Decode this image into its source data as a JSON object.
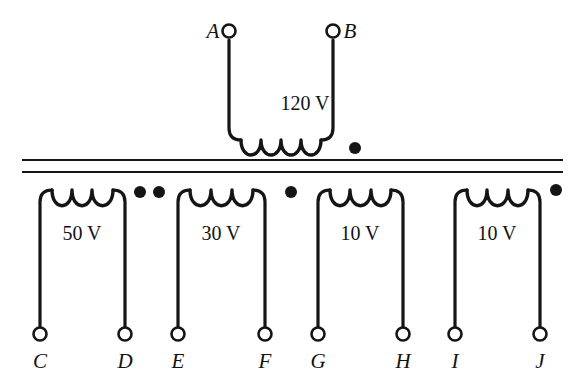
{
  "figure": {
    "background_color": "#ffffff",
    "ink_color": "#151515"
  },
  "core": {
    "name": "transformer-core",
    "lines": 2,
    "y_positions": [
      160,
      172
    ],
    "x_start": 22,
    "x_end": 563
  },
  "primary": {
    "label": "120 V",
    "label_x": 305,
    "label_y": 110,
    "terminals": [
      {
        "id": "A",
        "label": "A",
        "x": 229,
        "y": 31,
        "label_side": "left"
      },
      {
        "id": "B",
        "label": "B",
        "x": 333,
        "y": 31,
        "label_side": "right"
      }
    ],
    "coil_turns": 4,
    "coil_y": 140,
    "dot": {
      "x": 355,
      "y": 148,
      "r": 6
    }
  },
  "secondaries": [
    {
      "name": "secondary-50v",
      "label": "50 V",
      "label_x": 82,
      "label_y": 240,
      "coil_turns": 3,
      "coil_y": 190,
      "left_x": 40,
      "right_x": 125,
      "terminal_y": 334,
      "terminals": [
        {
          "id": "C",
          "label": "C",
          "x": 40
        },
        {
          "id": "D",
          "label": "D",
          "x": 125
        }
      ],
      "dots": [
        {
          "x": 140,
          "y": 192,
          "r": 6
        },
        {
          "x": 159,
          "y": 192,
          "r": 6
        }
      ]
    },
    {
      "name": "secondary-30v",
      "label": "30 V",
      "label_x": 221,
      "label_y": 240,
      "coil_turns": 3,
      "coil_y": 190,
      "left_x": 178,
      "right_x": 265,
      "terminal_y": 334,
      "terminals": [
        {
          "id": "E",
          "label": "E",
          "x": 178
        },
        {
          "id": "F",
          "label": "F",
          "x": 265
        }
      ],
      "dots": [
        {
          "x": 291,
          "y": 192,
          "r": 6
        }
      ]
    },
    {
      "name": "secondary-10v-first",
      "label": "10 V",
      "label_x": 360,
      "label_y": 240,
      "coil_turns": 3,
      "coil_y": 190,
      "left_x": 318,
      "right_x": 403,
      "terminal_y": 334,
      "terminals": [
        {
          "id": "G",
          "label": "G",
          "x": 318
        },
        {
          "id": "H",
          "label": "H",
          "x": 403
        }
      ],
      "dots": []
    },
    {
      "name": "secondary-10v-second",
      "label": "10 V",
      "label_x": 497,
      "label_y": 240,
      "coil_turns": 3,
      "coil_y": 190,
      "left_x": 455,
      "right_x": 540,
      "terminal_y": 334,
      "terminals": [
        {
          "id": "I",
          "label": "I",
          "x": 455
        },
        {
          "id": "J",
          "label": "J",
          "x": 540
        }
      ],
      "dots": [
        {
          "x": 556,
          "y": 190,
          "r": 6
        }
      ]
    }
  ]
}
